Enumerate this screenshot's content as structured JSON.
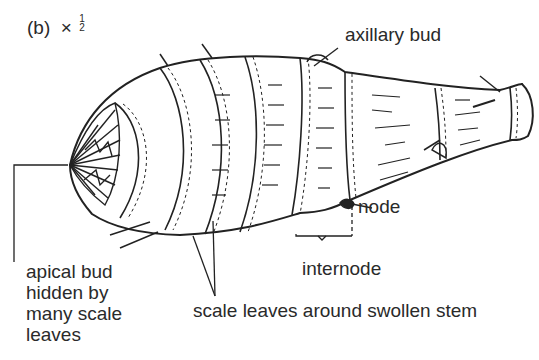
{
  "figure": {
    "label": "(b)",
    "scale_prefix": "×",
    "scale_numerator": "1",
    "scale_denominator": "2"
  },
  "labels": {
    "axillary_bud": "axillary bud",
    "node": "node",
    "internode": "internode",
    "apical_bud_lines": [
      "apical bud",
      "hidden by",
      "many scale",
      "leaves"
    ],
    "scale_leaves": "scale leaves around swollen stem"
  },
  "colors": {
    "ink": "#2a2a2a",
    "background": "#ffffff"
  }
}
